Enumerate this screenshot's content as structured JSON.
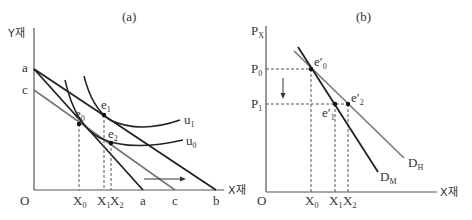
{
  "panel_a": {
    "title": "(a)",
    "y_axis_label": "Y재",
    "x_axis_label": "X재",
    "origin": "O",
    "y_intercepts": [
      "a",
      "c"
    ],
    "x_intercepts": [
      "a",
      "c",
      "b"
    ],
    "x_ticks": [
      {
        "base": "X",
        "sub": "0"
      },
      {
        "base": "X",
        "sub": "1"
      },
      {
        "base": "X",
        "sub": "2"
      }
    ],
    "points": [
      {
        "base": "e",
        "sub": "0"
      },
      {
        "base": "e",
        "sub": "1"
      },
      {
        "base": "e",
        "sub": "2"
      }
    ],
    "curves": [
      {
        "base": "u",
        "sub": "1"
      },
      {
        "base": "u",
        "sub": "0"
      }
    ],
    "budget_lines": [
      "a-a",
      "a-b",
      "c-c"
    ],
    "arrow": "rightward shift"
  },
  "panel_b": {
    "title": "(b)",
    "y_axis_label": {
      "base": "P",
      "sub": "X"
    },
    "x_axis_label": "X재",
    "left_label": "X재",
    "origin": "O",
    "y_ticks": [
      {
        "base": "P",
        "sub": "0"
      },
      {
        "base": "P",
        "sub": "1"
      }
    ],
    "x_ticks": [
      {
        "base": "X",
        "sub": "0"
      },
      {
        "base": "X",
        "sub": "1"
      },
      {
        "base": "X",
        "sub": "2"
      }
    ],
    "points": [
      {
        "base": "e′",
        "sub": "0"
      },
      {
        "base": "e′",
        "sub": "1"
      },
      {
        "base": "e′",
        "sub": "2"
      }
    ],
    "demand_curves": [
      {
        "base": "D",
        "sub": "H"
      },
      {
        "base": "D",
        "sub": "M"
      }
    ],
    "arrow": "downward price change"
  }
}
